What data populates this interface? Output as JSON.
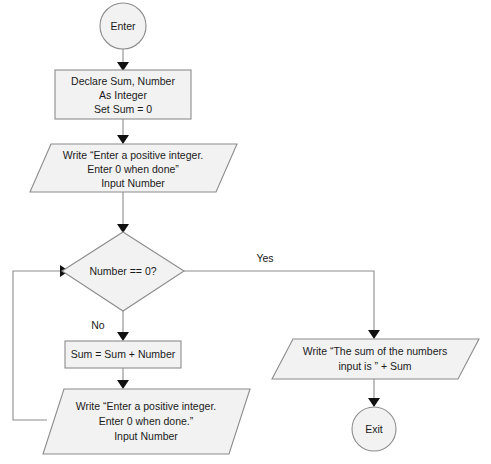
{
  "diagram": {
    "colors": {
      "shape_fill": "#f2f2f2",
      "shape_stroke": "#8c8c8c",
      "connector": "#8c8c8c",
      "arrow": "#111111",
      "text": "#1a1a1a",
      "background": "#ffffff"
    },
    "nodes": {
      "start": {
        "type": "terminator",
        "label": "Enter"
      },
      "declare": {
        "type": "process",
        "line1": "Declare Sum, Number",
        "line2": "As Integer",
        "line3": "Set Sum = 0"
      },
      "first_input": {
        "type": "input-output",
        "line1": "Write “Enter a positive integer.",
        "line2": "Enter 0 when done”",
        "line3": "Input Number"
      },
      "decision": {
        "type": "decision",
        "label": "Number == 0?"
      },
      "accumulate": {
        "type": "process",
        "label": "Sum = Sum + Number"
      },
      "loop_input": {
        "type": "input-output",
        "line1": "Write “Enter a positive integer.",
        "line2": "Enter 0 when done.”",
        "line3": "Input Number"
      },
      "output": {
        "type": "input-output",
        "line1": "Write “The sum of the numbers",
        "line2": "input is ” + Sum"
      },
      "end": {
        "type": "terminator",
        "label": "Exit"
      }
    },
    "edge_labels": {
      "yes": "Yes",
      "no": "No"
    }
  }
}
